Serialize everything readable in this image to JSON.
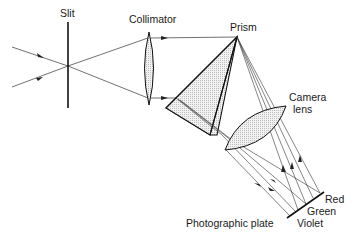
{
  "diagram": {
    "labels": {
      "slit": "Slit",
      "collimator": "Collimator",
      "prism": "Prism",
      "camera_lens_line1": "Camera",
      "camera_lens_line2": "lens",
      "red": "Red",
      "green": "Green",
      "violet": "Violet",
      "photographic_plate": "Photographic plate"
    },
    "colors": {
      "line": "#1a1a1a",
      "fill": "#e6e6e6"
    }
  }
}
